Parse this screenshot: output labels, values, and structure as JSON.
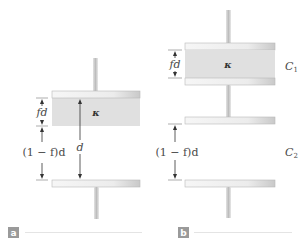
{
  "figure": {
    "colors": {
      "plate_fill": "#eeeeee",
      "plate_edge": "#b8b8b8",
      "stem": "#cfcfcf",
      "dielectric": "#e0e0e0",
      "arrow": "#333333",
      "text": "#4a4a4a",
      "tag_bg": "#9a9a9a",
      "rule": "#dddddd"
    },
    "panel_a": {
      "tag": "a",
      "dielectric_label": "κ",
      "dielectric_thickness_label": "fd",
      "gap_label": "(1 − f)d",
      "separation_label": "d"
    },
    "panel_b": {
      "tag": "b",
      "dielectric_label": "κ",
      "dielectric_thickness_label": "fd",
      "gap_label": "(1 − f)d",
      "capacitor_1_label": "C",
      "capacitor_1_sub": "1",
      "capacitor_2_label": "C",
      "capacitor_2_sub": "2"
    }
  }
}
